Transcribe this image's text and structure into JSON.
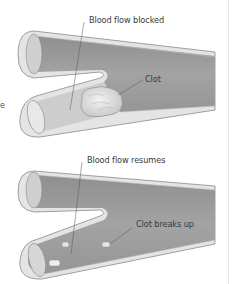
{
  "figure": {
    "panels": [
      {
        "id": "blocked",
        "labels": {
          "flow": "Blood flow blocked",
          "clot": "Clot"
        }
      },
      {
        "id": "resumes",
        "labels": {
          "flow": "Blood flow resumes",
          "clot": "Clot breaks up"
        }
      }
    ],
    "edge_fragment": "e"
  },
  "colors": {
    "vessel_lumen": "#9a9a9a",
    "vessel_wall": "#d9d9d9",
    "vessel_outline": "#8a8a8a",
    "clot_fill": "#d6d6d6",
    "blocked_segment": "#cfcfcf",
    "leader_line": "#555555",
    "label_text": "#3a3a3a"
  }
}
